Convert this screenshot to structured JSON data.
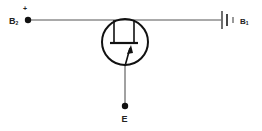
{
  "diagram": {
    "type": "circuit-schematic",
    "colors": {
      "line": "#333333",
      "dot": "#111111",
      "background": "#ffffff"
    },
    "terminals": {
      "b2": {
        "label": "B",
        "subscript": "2",
        "polarity": "+"
      },
      "b1": {
        "label": "B",
        "subscript": "1"
      },
      "emitter": {
        "label": "E"
      }
    },
    "components": [
      {
        "id": "ujt",
        "kind": "unijunction-transistor"
      },
      {
        "id": "battery",
        "kind": "battery-cell"
      }
    ]
  }
}
